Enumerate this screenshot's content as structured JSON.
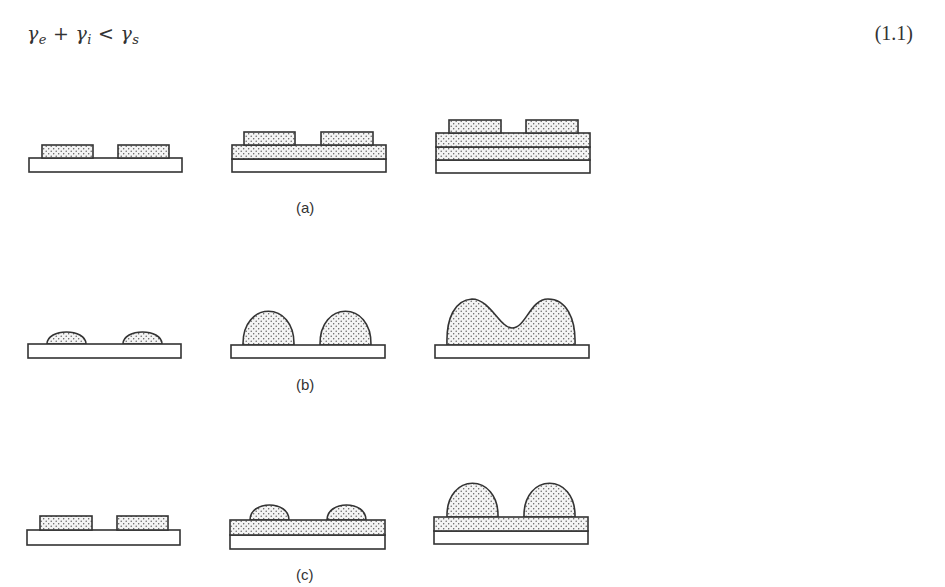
{
  "equation": {
    "gamma_e": "γ",
    "sub_e": "e",
    "plus": "+",
    "gamma_i": "γ",
    "sub_i": "i",
    "less_than": "<",
    "gamma_s": "γ",
    "sub_s": "s",
    "number": "(1.1)"
  },
  "figure": {
    "rows": [
      {
        "label": "(a)",
        "description": "Layer-by-layer growth: flat islands on substrate, then on one and two continuous film layers"
      },
      {
        "label": "(b)",
        "description": "Island growth: small caps grow into large domes that coalesce"
      },
      {
        "label": "(c)",
        "description": "Layer-plus-island growth: flat islands form a layer, then domes grow on top"
      }
    ],
    "colors": {
      "stroke": "#333333",
      "substrate_fill": "#ffffff",
      "film_fill": "#f4f4f4",
      "dot": "#555555"
    }
  }
}
